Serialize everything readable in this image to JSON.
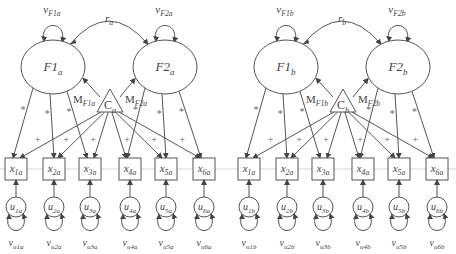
{
  "diagram": {
    "type": "structural-equation-model",
    "panels": [
      {
        "id": "a",
        "factors": [
          {
            "id": "F1a",
            "base": "F1",
            "sub": "a",
            "variance": {
              "base": "v",
              "sub": "F1a"
            }
          },
          {
            "id": "F2a",
            "base": "F2",
            "sub": "a",
            "variance": {
              "base": "v",
              "sub": "F2a"
            }
          }
        ],
        "correlation": {
          "base": "r",
          "sub": "a"
        },
        "method": {
          "base": "C",
          "sub": "a"
        },
        "method_paths": [
          {
            "base": "M",
            "sub": "F1a"
          },
          {
            "base": "M",
            "sub": "F2a"
          }
        ],
        "indicators": [
          {
            "base": "x",
            "sub": "1a"
          },
          {
            "base": "x",
            "sub": "2a"
          },
          {
            "base": "x",
            "sub": "3a"
          },
          {
            "base": "x",
            "sub": "4a"
          },
          {
            "base": "x",
            "sub": "5a"
          },
          {
            "base": "x",
            "sub": "6a"
          }
        ],
        "uniquenesses": [
          {
            "base": "u",
            "sub": "1a"
          },
          {
            "base": "u",
            "sub": "2a"
          },
          {
            "base": "u",
            "sub": "3a"
          },
          {
            "base": "u",
            "sub": "4a"
          },
          {
            "base": "u",
            "sub": "5a"
          },
          {
            "base": "u",
            "sub": "6a"
          }
        ],
        "uniqueness_variances": [
          {
            "base": "v",
            "sub": "u1a"
          },
          {
            "base": "v",
            "sub": "u2a"
          },
          {
            "base": "v",
            "sub": "u3a"
          },
          {
            "base": "v",
            "sub": "u4a"
          },
          {
            "base": "v",
            "sub": "u5a"
          },
          {
            "base": "v",
            "sub": "u6a"
          }
        ]
      },
      {
        "id": "b",
        "factors": [
          {
            "id": "F1b",
            "base": "F1",
            "sub": "b",
            "variance": {
              "base": "v",
              "sub": "F1b"
            }
          },
          {
            "id": "F2b",
            "base": "F2",
            "sub": "b",
            "variance": {
              "base": "v",
              "sub": "F2b"
            }
          }
        ],
        "correlation": {
          "base": "r",
          "sub": "b"
        },
        "method": {
          "base": "C",
          "sub": "b"
        },
        "method_paths": [
          {
            "base": "M",
            "sub": "F1b"
          },
          {
            "base": "M",
            "sub": "F2b"
          }
        ],
        "indicators": [
          {
            "base": "x",
            "sub": "1a"
          },
          {
            "base": "x",
            "sub": "2a"
          },
          {
            "base": "x",
            "sub": "3a"
          },
          {
            "base": "x",
            "sub": "4a"
          },
          {
            "base": "x",
            "sub": "5a"
          },
          {
            "base": "x",
            "sub": "6a"
          }
        ],
        "uniquenesses": [
          {
            "base": "u",
            "sub": "1b"
          },
          {
            "base": "u",
            "sub": "2b"
          },
          {
            "base": "u",
            "sub": "3b"
          },
          {
            "base": "u",
            "sub": "4b"
          },
          {
            "base": "u",
            "sub": "5b"
          },
          {
            "base": "u",
            "sub": "6b"
          }
        ],
        "uniqueness_variances": [
          {
            "base": "v",
            "sub": "u1b"
          },
          {
            "base": "v",
            "sub": "u2b"
          },
          {
            "base": "v",
            "sub": "u3b"
          },
          {
            "base": "v",
            "sub": "u4b"
          },
          {
            "base": "v",
            "sub": "u5b"
          },
          {
            "base": "v",
            "sub": "u6b"
          }
        ]
      }
    ],
    "loading_marker": "*",
    "method_loading_marker": "+",
    "colors": {
      "stroke": "#555555",
      "text": "#444444",
      "background": "#ffffff"
    }
  }
}
